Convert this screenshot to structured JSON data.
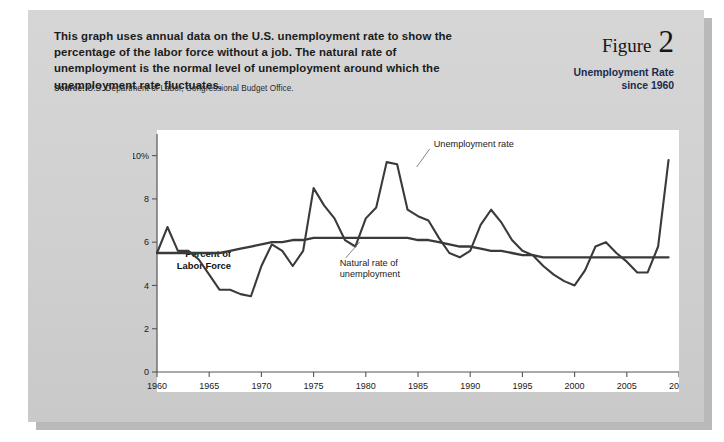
{
  "figure": {
    "label": "Figure",
    "number": "2",
    "subtitle_line1": "Unemployment Rate",
    "subtitle_line2": "since 1960",
    "intro": "This graph uses annual data on the U.S. unemployment rate to show the percentage of the labor force without a job. The natural rate of unemployment is the normal level of unemployment around which the unemployment rate fluctuates.",
    "source_label": "Source:",
    "source_text": "U.S. Department of Labor, Congressional Budget Office."
  },
  "colors": {
    "card": "#d2d2d2",
    "plot_bg": "#ffffff",
    "line": "#3a3a3a",
    "subtitle": "#1b2b4d"
  },
  "chart_data": {
    "type": "line",
    "title": "Unemployment Rate since 1960",
    "xlabel": "",
    "ylabel": "Percent of Labor Force",
    "ylabel_line1": "Percent of",
    "ylabel_line2": "Labor Force",
    "xlim": [
      1960,
      2010
    ],
    "ylim": [
      0,
      11
    ],
    "grid": false,
    "legend_position": "inline-annotation",
    "y_ticks": [
      0,
      2,
      4,
      6,
      8,
      10
    ],
    "y_tick_labels": [
      "0",
      "2",
      "4",
      "6",
      "8",
      "10%"
    ],
    "x_ticks": [
      1960,
      1965,
      1970,
      1975,
      1980,
      1985,
      1990,
      1995,
      2000,
      2005,
      2010
    ],
    "x_tick_labels": [
      "1960",
      "1965",
      "1970",
      "1975",
      "1980",
      "1985",
      "1990",
      "1995",
      "2000",
      "2005",
      "2010"
    ],
    "annotations": [
      {
        "name": "unemployment-rate",
        "text": "Unemployment rate",
        "x": 1986.5,
        "y": 10.4
      },
      {
        "name": "natural-rate",
        "text_line1": "Natural rate of",
        "text_line2": "unemployment",
        "x": 1977.5,
        "y": 4.9
      }
    ],
    "x": [
      1960,
      1961,
      1962,
      1963,
      1964,
      1965,
      1966,
      1967,
      1968,
      1969,
      1970,
      1971,
      1972,
      1973,
      1974,
      1975,
      1976,
      1977,
      1978,
      1979,
      1980,
      1981,
      1982,
      1983,
      1984,
      1985,
      1986,
      1987,
      1988,
      1989,
      1990,
      1991,
      1992,
      1993,
      1994,
      1995,
      1996,
      1997,
      1998,
      1999,
      2000,
      2001,
      2002,
      2003,
      2004,
      2005,
      2006,
      2007,
      2008,
      2009
    ],
    "series": [
      {
        "name": "Unemployment rate",
        "values": [
          5.5,
          6.7,
          5.6,
          5.6,
          5.2,
          4.5,
          3.8,
          3.8,
          3.6,
          3.5,
          4.9,
          5.9,
          5.6,
          4.9,
          5.6,
          8.5,
          7.7,
          7.1,
          6.1,
          5.8,
          7.1,
          7.6,
          9.7,
          9.6,
          7.5,
          7.2,
          7.0,
          6.2,
          5.5,
          5.3,
          5.6,
          6.8,
          7.5,
          6.9,
          6.1,
          5.6,
          5.4,
          4.9,
          4.5,
          4.2,
          4.0,
          4.7,
          5.8,
          6.0,
          5.5,
          5.1,
          4.6,
          4.6,
          5.8,
          9.8
        ]
      },
      {
        "name": "Natural rate of unemployment",
        "values": [
          5.5,
          5.5,
          5.5,
          5.5,
          5.5,
          5.5,
          5.5,
          5.6,
          5.7,
          5.8,
          5.9,
          6.0,
          6.0,
          6.1,
          6.1,
          6.2,
          6.2,
          6.2,
          6.2,
          6.2,
          6.2,
          6.2,
          6.2,
          6.2,
          6.2,
          6.1,
          6.1,
          6.0,
          5.9,
          5.8,
          5.8,
          5.7,
          5.6,
          5.6,
          5.5,
          5.4,
          5.4,
          5.3,
          5.3,
          5.3,
          5.3,
          5.3,
          5.3,
          5.3,
          5.3,
          5.3,
          5.3,
          5.3,
          5.3,
          5.3
        ]
      }
    ]
  }
}
